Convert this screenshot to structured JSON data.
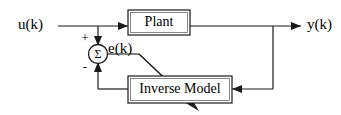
{
  "diagram": {
    "colors": {
      "line": "#1a1a1a",
      "background": "#ffffff",
      "box_fill": "#ffffff",
      "box_inner_stroke": "#555555"
    },
    "blocks": [
      {
        "id": "plant",
        "label": "Plant"
      },
      {
        "id": "inverse_model",
        "label": "Inverse Model"
      }
    ],
    "summing_junction": {
      "symbol": "Σ",
      "plus_sign": "+",
      "minus_sign": "-"
    },
    "signals": [
      {
        "id": "input",
        "label": "u(k)"
      },
      {
        "id": "error",
        "label": "e(k)"
      },
      {
        "id": "output",
        "label": "y(k)"
      }
    ]
  }
}
